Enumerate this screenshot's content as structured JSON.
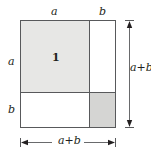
{
  "figure": {
    "name": "binomial-square-decomposition",
    "colors": {
      "stroke": "#58595b",
      "text": "#231f20",
      "shade_light": "#e7e7e5",
      "shade_dark": "#d5d5d3",
      "white": "#ffffff",
      "background": "#ffffff"
    }
  },
  "labels": {
    "top_a": "a",
    "top_b": "b",
    "left_a": "a",
    "left_b": "b",
    "right_total": "a+b",
    "bottom_total": "a+b"
  },
  "cells": [
    {
      "id": 1,
      "label": "1",
      "position": "top-left",
      "width_term": "a",
      "height_term": "a",
      "fill": "shade_light"
    },
    {
      "id": 2,
      "label": "2",
      "position": "top-right",
      "width_term": "b",
      "height_term": "a",
      "fill": "white"
    },
    {
      "id": 3,
      "label": "3",
      "position": "bottom-left",
      "width_term": "a",
      "height_term": "b",
      "fill": "white"
    },
    {
      "id": 4,
      "label": "4",
      "position": "bottom-right",
      "width_term": "b",
      "height_term": "b",
      "fill": "shade_dark"
    }
  ],
  "dimensions": {
    "vertical_arrow_label": "a+b",
    "horizontal_arrow_label": "a+b"
  }
}
